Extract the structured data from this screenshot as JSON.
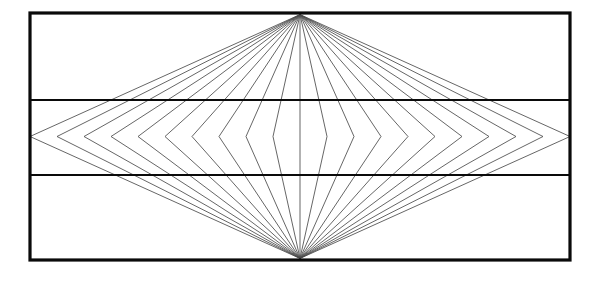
{
  "figure": {
    "type": "map-projection-graticule",
    "background_color": "#ffffff"
  },
  "canvas": {
    "width": 598,
    "height": 281
  },
  "neatline": {
    "label": "map frame",
    "x": 30,
    "y": 13,
    "width": 540,
    "height": 247,
    "stroke_color": "#0a0a0a",
    "stroke_width": 3.2
  },
  "poles": {
    "north_pole": {
      "x": 300,
      "y": 14.6,
      "label": "North Pole"
    },
    "south_pole": {
      "x": 300,
      "y": 258.4,
      "label": "South Pole"
    }
  },
  "equator": {
    "y": 136.5,
    "label": "Equator",
    "drawn": false
  },
  "parallels": [
    {
      "label": "Upper standard parallel",
      "y": 100.0,
      "x1": 30,
      "x2": 570,
      "stroke_color": "#0a0a0a",
      "stroke_width": 2.1
    },
    {
      "label": "Lower standard parallel",
      "y": 175.0,
      "x1": 30,
      "x2": 570,
      "stroke_color": "#0a0a0a",
      "stroke_width": 2.1
    }
  ],
  "central_meridian": {
    "label": "Central meridian",
    "x": 300,
    "y1": 14.6,
    "y2": 258.4,
    "stroke_color": "#4a4a4a",
    "stroke_width": 0.85
  },
  "meridian_set": {
    "label": "Meridians",
    "count_each_side": 10,
    "stroke_color": "#4a4a4a",
    "stroke_width": 0.85,
    "equator_half_width": 270,
    "pole_x": 300,
    "note": "Each meridian is a straight line from the north pole to its equator point, then a straight line from that equator point to the south pole.",
    "equator_offsets": [
      27.0,
      54.0,
      81.0,
      108.0,
      135.0,
      162.0,
      189.0,
      216.0,
      243.0,
      270.0
    ]
  },
  "chart_data": {
    "type": "line",
    "xlabel": "",
    "ylabel": "",
    "xlim": [
      30,
      570
    ],
    "ylim": [
      13,
      260
    ],
    "grid": false,
    "legend": "none",
    "series": [
      {
        "name": "neatline",
        "values": [
          [
            30,
            13
          ],
          [
            570,
            13
          ],
          [
            570,
            260
          ],
          [
            30,
            260
          ],
          [
            30,
            13
          ]
        ]
      },
      {
        "name": "upper-parallel",
        "values": [
          [
            30,
            100
          ],
          [
            570,
            100
          ]
        ]
      },
      {
        "name": "lower-parallel",
        "values": [
          [
            30,
            175
          ],
          [
            570,
            175
          ]
        ]
      },
      {
        "name": "central-meridian",
        "values": [
          [
            300,
            14.6
          ],
          [
            300,
            258.4
          ]
        ]
      },
      {
        "name": "meridian-west-1",
        "values": [
          [
            300,
            14.6
          ],
          [
            273,
            136.5
          ],
          [
            300,
            258.4
          ]
        ]
      },
      {
        "name": "meridian-west-2",
        "values": [
          [
            300,
            14.6
          ],
          [
            246,
            136.5
          ],
          [
            300,
            258.4
          ]
        ]
      },
      {
        "name": "meridian-west-3",
        "values": [
          [
            300,
            14.6
          ],
          [
            219,
            136.5
          ],
          [
            300,
            258.4
          ]
        ]
      },
      {
        "name": "meridian-west-4",
        "values": [
          [
            300,
            14.6
          ],
          [
            192,
            136.5
          ],
          [
            300,
            258.4
          ]
        ]
      },
      {
        "name": "meridian-west-5",
        "values": [
          [
            300,
            14.6
          ],
          [
            165,
            136.5
          ],
          [
            300,
            258.4
          ]
        ]
      },
      {
        "name": "meridian-west-6",
        "values": [
          [
            300,
            14.6
          ],
          [
            138,
            136.5
          ],
          [
            300,
            258.4
          ]
        ]
      },
      {
        "name": "meridian-west-7",
        "values": [
          [
            300,
            14.6
          ],
          [
            111,
            136.5
          ],
          [
            300,
            258.4
          ]
        ]
      },
      {
        "name": "meridian-west-8",
        "values": [
          [
            300,
            14.6
          ],
          [
            84,
            136.5
          ],
          [
            300,
            258.4
          ]
        ]
      },
      {
        "name": "meridian-west-9",
        "values": [
          [
            300,
            14.6
          ],
          [
            57,
            136.5
          ],
          [
            300,
            258.4
          ]
        ]
      },
      {
        "name": "meridian-west-10",
        "values": [
          [
            300,
            14.6
          ],
          [
            30,
            136.5
          ],
          [
            300,
            258.4
          ]
        ]
      },
      {
        "name": "meridian-east-1",
        "values": [
          [
            300,
            14.6
          ],
          [
            327,
            136.5
          ],
          [
            300,
            258.4
          ]
        ]
      },
      {
        "name": "meridian-east-2",
        "values": [
          [
            300,
            14.6
          ],
          [
            354,
            136.5
          ],
          [
            300,
            258.4
          ]
        ]
      },
      {
        "name": "meridian-east-3",
        "values": [
          [
            300,
            14.6
          ],
          [
            381,
            136.5
          ],
          [
            300,
            258.4
          ]
        ]
      },
      {
        "name": "meridian-east-4",
        "values": [
          [
            300,
            14.6
          ],
          [
            408,
            136.5
          ],
          [
            300,
            258.4
          ]
        ]
      },
      {
        "name": "meridian-east-5",
        "values": [
          [
            300,
            14.6
          ],
          [
            435,
            136.5
          ],
          [
            300,
            258.4
          ]
        ]
      },
      {
        "name": "meridian-east-6",
        "values": [
          [
            300,
            14.6
          ],
          [
            462,
            136.5
          ],
          [
            300,
            258.4
          ]
        ]
      },
      {
        "name": "meridian-east-7",
        "values": [
          [
            300,
            14.6
          ],
          [
            489,
            136.5
          ],
          [
            300,
            258.4
          ]
        ]
      },
      {
        "name": "meridian-east-8",
        "values": [
          [
            300,
            14.6
          ],
          [
            516,
            136.5
          ],
          [
            300,
            258.4
          ]
        ]
      },
      {
        "name": "meridian-east-9",
        "values": [
          [
            300,
            14.6
          ],
          [
            543,
            136.5
          ],
          [
            300,
            258.4
          ]
        ]
      },
      {
        "name": "meridian-east-10",
        "values": [
          [
            300,
            14.6
          ],
          [
            570,
            136.5
          ],
          [
            300,
            258.4
          ]
        ]
      }
    ]
  }
}
